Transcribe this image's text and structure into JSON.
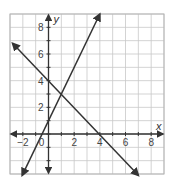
{
  "chart_data": {
    "type": "line",
    "title": "",
    "xlabel": "x",
    "ylabel": "y",
    "xlim": [
      -3,
      9
    ],
    "ylim": [
      -3,
      9
    ],
    "grid": true,
    "x_ticks": [
      "-2",
      "0",
      "2",
      "4",
      "6",
      "8"
    ],
    "y_ticks": [
      "2",
      "4",
      "6",
      "8"
    ],
    "series": [
      {
        "name": "line-1",
        "equation": "y = 2x + 1",
        "x": [
          -2.3,
          4
        ],
        "y": [
          -3.6,
          9
        ],
        "color": "#333333"
      },
      {
        "name": "line-2",
        "equation": "y = -x + 4",
        "x": [
          -3,
          7
        ],
        "y": [
          7,
          -3
        ],
        "color": "#333333"
      }
    ],
    "intersection": {
      "x": 1,
      "y": 3
    }
  },
  "labels": {
    "x_axis": "x",
    "y_axis": "y",
    "xticks": [
      {
        "v": -2,
        "t": "−2"
      },
      {
        "v": 0,
        "t": "0"
      },
      {
        "v": 2,
        "t": "2"
      },
      {
        "v": 4,
        "t": "4"
      },
      {
        "v": 6,
        "t": "6"
      },
      {
        "v": 8,
        "t": "8"
      }
    ],
    "yticks": [
      {
        "v": 2,
        "t": "2"
      },
      {
        "v": 4,
        "t": "4"
      },
      {
        "v": 6,
        "t": "6"
      },
      {
        "v": 8,
        "t": "8"
      }
    ]
  },
  "colors": {
    "grid": "#c8c8c8",
    "axis": "#333333",
    "line": "#333333",
    "border": "#b5b5b5"
  }
}
